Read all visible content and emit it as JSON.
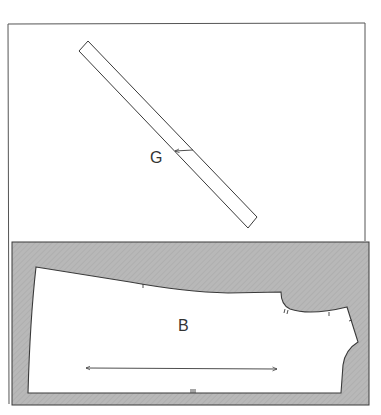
{
  "diagram": {
    "colors": {
      "background": "#ffffff",
      "outline": "#3a3a3a",
      "fabric": "#b5b5b5",
      "piece_fill": "#ffffff"
    },
    "top_panel": {
      "piece_label": "G",
      "piece_type": "bias strip",
      "grainline": "arrow across strip width"
    },
    "bottom_panel": {
      "piece_label": "B",
      "piece_type": "bodice/body piece on shaded fabric",
      "grainline": "horizontal double-ended arrow",
      "notches": [
        "single notch on top edge",
        "double notch at armhole",
        "single notch on shoulder",
        "single notch on neckline side",
        "triple notch on bottom edge"
      ]
    }
  }
}
